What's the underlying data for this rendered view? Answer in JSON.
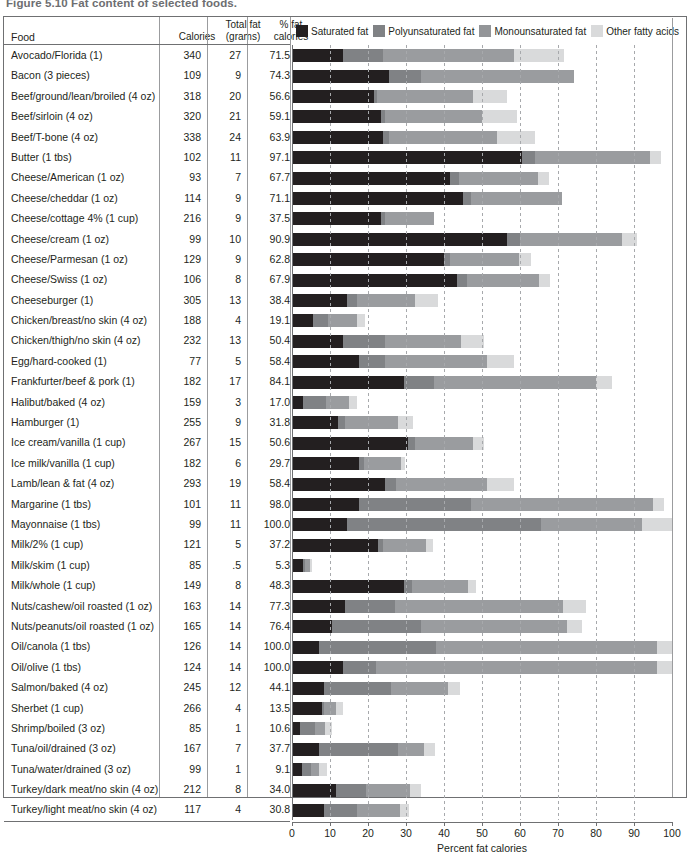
{
  "figure": {
    "title": "Figure 5.10  Fat content of selected foods.",
    "x_axis_label": "Percent fat calories"
  },
  "columns": {
    "food": "Food",
    "calories": "Calories",
    "total_fat": "Total fat\n(grams)",
    "total_fat_l1": "Total fat",
    "total_fat_l2": "(grams)",
    "pct_fat_l1": "% fat",
    "pct_fat_l2": "calories"
  },
  "legend": [
    {
      "label": "Saturated fat",
      "color": "#231f20"
    },
    {
      "label": "Polyunsaturated fat",
      "color": "#808285"
    },
    {
      "label": "Monounsaturated fat",
      "color": "#939598"
    },
    {
      "label": "Other fatty acids",
      "color": "#d9dadb"
    }
  ],
  "colors": {
    "saturated": "#231f20",
    "polyunsaturated": "#808285",
    "monounsaturated": "#9a9c9f",
    "other": "#d9dadb",
    "rule": "#6f7072",
    "grid": "#a7a9ac"
  },
  "chart_data": {
    "type": "bar",
    "orientation": "horizontal",
    "stacked": true,
    "title": "Figure 5.10  Fat content of selected foods.",
    "xlabel": "Percent fat calories",
    "ylabel": "",
    "xlim": [
      0,
      100
    ],
    "xticks": [
      0,
      10,
      20,
      30,
      40,
      50,
      60,
      70,
      80,
      90,
      100
    ],
    "grid": true,
    "grid_axis": "x",
    "legend_position": "top",
    "series": [
      {
        "name": "Saturated fat",
        "color": "#231f20"
      },
      {
        "name": "Polyunsaturated fat",
        "color": "#808285"
      },
      {
        "name": "Monounsaturated fat",
        "color": "#9a9c9f"
      },
      {
        "name": "Other fatty acids",
        "color": "#d9dadb"
      }
    ],
    "categories": [
      "Avocado/Florida (1)",
      "Bacon (3 pieces)",
      "Beef/ground/lean/broiled (4 oz)",
      "Beef/sirloin (4 oz)",
      "Beef/T-bone (4 oz)",
      "Butter (1 tbs)",
      "Cheese/American (1 oz)",
      "Cheese/cheddar (1 oz)",
      "Cheese/cottage 4% (1 cup)",
      "Cheese/cream (1 oz)",
      "Cheese/Parmesan (1 oz)",
      "Cheese/Swiss (1 oz)",
      "Cheeseburger (1)",
      "Chicken/breast/no skin (4 oz)",
      "Chicken/thigh/no skin (4 oz)",
      "Egg/hard-cooked (1)",
      "Frankfurter/beef & pork (1)",
      "Halibut/baked (4 oz)",
      "Hamburger (1)",
      "Ice cream/vanilla (1 cup)",
      "Ice milk/vanilla (1 cup)",
      "Lamb/lean & fat (4 oz)",
      "Margarine (1 tbs)",
      "Mayonnaise (1 tbs)",
      "Milk/2% (1 cup)",
      "Milk/skim (1 cup)",
      "Milk/whole (1 cup)",
      "Nuts/cashew/oil roasted (1 oz)",
      "Nuts/peanuts/oil roasted (1 oz)",
      "Oil/canola (1 tbs)",
      "Oil/olive (1 tbs)",
      "Salmon/baked (4 oz)",
      "Sherbet (1 cup)",
      "Shrimp/boiled (3 oz)",
      "Tuna/oil/drained (3 oz)",
      "Tuna/water/drained (3 oz)",
      "Turkey/dark meat/no skin (4 oz)",
      "Turkey/light meat/no skin (4 oz)"
    ],
    "totals": [
      71.5,
      74.3,
      56.6,
      59.1,
      63.9,
      97.1,
      67.7,
      71.1,
      37.5,
      90.9,
      62.8,
      67.9,
      38.4,
      19.1,
      50.4,
      58.4,
      84.1,
      17.0,
      31.8,
      50.6,
      29.7,
      58.4,
      98.0,
      100.0,
      37.2,
      5.3,
      48.3,
      77.3,
      76.4,
      100.0,
      100.0,
      44.1,
      13.5,
      10.6,
      37.7,
      9.1,
      34.0,
      30.8
    ]
  },
  "rows": [
    {
      "food": "Avocado/Florida (1)",
      "calories": "340",
      "total_fat": "27",
      "pct_fat": "71.5",
      "segments": [
        13.5,
        10.5,
        34.5,
        13.0
      ]
    },
    {
      "food": "Bacon (3 pieces)",
      "calories": "109",
      "total_fat": "9",
      "pct_fat": "74.3",
      "segments": [
        25.5,
        8.5,
        40.3,
        0.0
      ]
    },
    {
      "food": "Beef/ground/lean/broiled (4 oz)",
      "calories": "318",
      "total_fat": "20",
      "pct_fat": "56.6",
      "segments": [
        21.5,
        1.0,
        25.1,
        9.0
      ]
    },
    {
      "food": "Beef/sirloin (4 oz)",
      "calories": "320",
      "total_fat": "21",
      "pct_fat": "59.1",
      "segments": [
        23.5,
        1.0,
        25.6,
        9.0
      ]
    },
    {
      "food": "Beef/T-bone (4 oz)",
      "calories": "338",
      "total_fat": "24",
      "pct_fat": "63.9",
      "segments": [
        24.0,
        1.5,
        28.4,
        10.0
      ]
    },
    {
      "food": "Butter (1 tbs)",
      "calories": "102",
      "total_fat": "11",
      "pct_fat": "97.1",
      "segments": [
        60.5,
        3.5,
        30.1,
        3.0
      ]
    },
    {
      "food": "Cheese/American (1 oz)",
      "calories": "93",
      "total_fat": "7",
      "pct_fat": "67.7",
      "segments": [
        41.5,
        2.5,
        20.7,
        3.0
      ]
    },
    {
      "food": "Cheese/cheddar (1 oz)",
      "calories": "114",
      "total_fat": "9",
      "pct_fat": "71.1",
      "segments": [
        45.0,
        2.0,
        24.1,
        0.0
      ]
    },
    {
      "food": "Cheese/cottage 4% (1 cup)",
      "calories": "216",
      "total_fat": "9",
      "pct_fat": "37.5",
      "segments": [
        23.5,
        1.0,
        13.0,
        0.0
      ]
    },
    {
      "food": "Cheese/cream (1 oz)",
      "calories": "99",
      "total_fat": "10",
      "pct_fat": "90.9",
      "segments": [
        56.5,
        3.5,
        26.9,
        4.0
      ]
    },
    {
      "food": "Cheese/Parmesan (1 oz)",
      "calories": "129",
      "total_fat": "9",
      "pct_fat": "62.8",
      "segments": [
        40.0,
        1.5,
        18.3,
        3.0
      ]
    },
    {
      "food": "Cheese/Swiss (1 oz)",
      "calories": "106",
      "total_fat": "8",
      "pct_fat": "67.9",
      "segments": [
        43.5,
        2.5,
        18.9,
        3.0
      ]
    },
    {
      "food": "Cheeseburger (1)",
      "calories": "305",
      "total_fat": "13",
      "pct_fat": "38.4",
      "segments": [
        14.5,
        2.5,
        15.4,
        6.0
      ]
    },
    {
      "food": "Chicken/breast/no skin (4 oz)",
      "calories": "188",
      "total_fat": "4",
      "pct_fat": "19.1",
      "segments": [
        5.5,
        4.0,
        7.6,
        2.0
      ]
    },
    {
      "food": "Chicken/thigh/no skin (4 oz)",
      "calories": "232",
      "total_fat": "13",
      "pct_fat": "50.4",
      "segments": [
        13.5,
        11.0,
        19.9,
        6.0
      ]
    },
    {
      "food": "Egg/hard-cooked (1)",
      "calories": "77",
      "total_fat": "5",
      "pct_fat": "58.4",
      "segments": [
        17.5,
        7.0,
        26.9,
        7.0
      ]
    },
    {
      "food": "Frankfurter/beef & pork (1)",
      "calories": "182",
      "total_fat": "17",
      "pct_fat": "84.1",
      "segments": [
        29.5,
        8.0,
        42.6,
        4.0
      ]
    },
    {
      "food": "Halibut/baked (4 oz)",
      "calories": "159",
      "total_fat": "3",
      "pct_fat": "17.0",
      "segments": [
        3.0,
        6.0,
        6.0,
        2.0
      ]
    },
    {
      "food": "Hamburger (1)",
      "calories": "255",
      "total_fat": "9",
      "pct_fat": "31.8",
      "segments": [
        12.0,
        2.0,
        13.8,
        4.0
      ]
    },
    {
      "food": "Ice cream/vanilla (1 cup)",
      "calories": "267",
      "total_fat": "15",
      "pct_fat": "50.6",
      "segments": [
        30.5,
        2.0,
        15.1,
        3.0
      ]
    },
    {
      "food": "Ice milk/vanilla (1 cup)",
      "calories": "182",
      "total_fat": "6",
      "pct_fat": "29.7",
      "segments": [
        17.5,
        1.5,
        9.7,
        1.0
      ]
    },
    {
      "food": "Lamb/lean & fat (4 oz)",
      "calories": "293",
      "total_fat": "19",
      "pct_fat": "58.4",
      "segments": [
        24.5,
        3.0,
        23.9,
        7.0
      ]
    },
    {
      "food": "Margarine (1 tbs)",
      "calories": "101",
      "total_fat": "11",
      "pct_fat": "98.0",
      "segments": [
        17.5,
        29.5,
        48.0,
        3.0
      ]
    },
    {
      "food": "Mayonnaise (1 tbs)",
      "calories": "99",
      "total_fat": "11",
      "pct_fat": "100.0",
      "segments": [
        14.5,
        51.0,
        26.5,
        8.0
      ]
    },
    {
      "food": "Milk/2% (1 cup)",
      "calories": "121",
      "total_fat": "5",
      "pct_fat": "37.2",
      "segments": [
        22.5,
        1.5,
        11.2,
        2.0
      ]
    },
    {
      "food": "Milk/skim (1 cup)",
      "calories": "85",
      "total_fat": ".5",
      "pct_fat": "5.3",
      "segments": [
        3.0,
        0.5,
        1.3,
        0.5
      ]
    },
    {
      "food": "Milk/whole (1 cup)",
      "calories": "149",
      "total_fat": "8",
      "pct_fat": "48.3",
      "segments": [
        29.5,
        2.0,
        14.8,
        2.0
      ]
    },
    {
      "food": "Nuts/cashew/oil roasted (1 oz)",
      "calories": "163",
      "total_fat": "14",
      "pct_fat": "77.3",
      "segments": [
        14.0,
        13.0,
        44.3,
        6.0
      ]
    },
    {
      "food": "Nuts/peanuts/oil roasted (1 oz)",
      "calories": "165",
      "total_fat": "14",
      "pct_fat": "76.4",
      "segments": [
        10.5,
        23.5,
        38.4,
        4.0
      ]
    },
    {
      "food": "Oil/canola (1 tbs)",
      "calories": "126",
      "total_fat": "14",
      "pct_fat": "100.0",
      "segments": [
        7.0,
        31.0,
        58.0,
        4.0
      ]
    },
    {
      "food": "Oil/olive (1 tbs)",
      "calories": "124",
      "total_fat": "14",
      "pct_fat": "100.0",
      "segments": [
        13.5,
        8.5,
        74.0,
        4.0
      ]
    },
    {
      "food": "Salmon/baked (4 oz)",
      "calories": "245",
      "total_fat": "12",
      "pct_fat": "44.1",
      "segments": [
        8.5,
        17.5,
        15.1,
        3.0
      ]
    },
    {
      "food": "Sherbet (1 cup)",
      "calories": "266",
      "total_fat": "4",
      "pct_fat": "13.5",
      "segments": [
        8.0,
        0.5,
        3.0,
        2.0
      ]
    },
    {
      "food": "Shrimp/boiled (3 oz)",
      "calories": "85",
      "total_fat": "1",
      "pct_fat": "10.6",
      "segments": [
        2.0,
        4.0,
        2.6,
        2.0
      ]
    },
    {
      "food": "Tuna/oil/drained (3 oz)",
      "calories": "167",
      "total_fat": "7",
      "pct_fat": "37.7",
      "segments": [
        7.0,
        21.0,
        6.7,
        3.0
      ]
    },
    {
      "food": "Tuna/water/drained (3 oz)",
      "calories": "99",
      "total_fat": "1",
      "pct_fat": "9.1",
      "segments": [
        2.5,
        2.5,
        2.1,
        2.0
      ]
    },
    {
      "food": "Turkey/dark meat/no skin (4 oz)",
      "calories": "212",
      "total_fat": "8",
      "pct_fat": "34.0",
      "segments": [
        11.5,
        8.0,
        11.5,
        3.0
      ]
    },
    {
      "food": "Turkey/light meat/no skin (4 oz)",
      "calories": "117",
      "total_fat": "4",
      "pct_fat": "30.8",
      "segments": [
        8.5,
        8.5,
        11.3,
        2.5
      ]
    }
  ],
  "x_ticks": [
    "0",
    "10",
    "20",
    "30",
    "40",
    "50",
    "60",
    "70",
    "80",
    "90",
    "100"
  ]
}
